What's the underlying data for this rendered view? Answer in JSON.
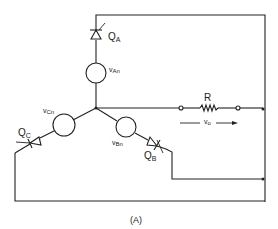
{
  "diagram": {
    "caption": "(A)",
    "sources": [
      {
        "id": "VAn",
        "label_main": "v",
        "label_sub": "An"
      },
      {
        "id": "VBn",
        "label_main": "v",
        "label_sub": "Bn"
      },
      {
        "id": "VCn",
        "label_main": "v",
        "label_sub": "Cn"
      }
    ],
    "thyristors": [
      {
        "id": "QA",
        "label_main": "Q",
        "label_sub": "A"
      },
      {
        "id": "QB",
        "label_main": "Q",
        "label_sub": "B"
      },
      {
        "id": "QC",
        "label_main": "Q",
        "label_sub": "C"
      }
    ],
    "resistor": {
      "label": "R"
    },
    "output_voltage": {
      "label_main": "v",
      "label_sub": "o"
    },
    "colors": {
      "line": "#222222",
      "background": "#ffffff"
    }
  }
}
